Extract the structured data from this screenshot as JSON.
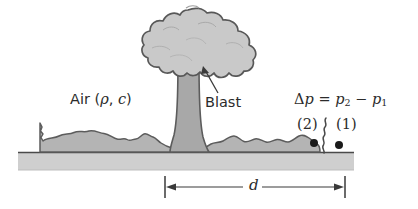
{
  "figure": {
    "labels": {
      "air_prefix": "Air (",
      "air_rho": "ρ",
      "air_comma": ", ",
      "air_c": "c",
      "air_suffix": ")",
      "blast": "Blast",
      "delta": "Δ",
      "eq_p": "p",
      "eq_equals": " = ",
      "eq_p2": "p",
      "eq_sub2": "2",
      "eq_minus": " − ",
      "eq_p1": "p",
      "eq_sub1": "1",
      "point_2": "(2)",
      "point_1": "(1)",
      "distance": "d"
    },
    "colors": {
      "cloud_fill": "#c9c9c9",
      "cloud_stroke": "#585858",
      "stem_fill": "#a8a8a8",
      "debris_fill": "#b4b4b4",
      "ground_fill": "#cfcfcf",
      "ground_line": "#555555",
      "text": "#2b2b2b",
      "background": "#ffffff",
      "dot": "#1a1a1a",
      "leader": "#3a3a3a"
    },
    "geometry": {
      "ground_top_y": 151,
      "ground_bottom_y": 170,
      "dim_line_y": 187,
      "dim_left_x": 165,
      "dim_right_x": 345,
      "point2_x": 314,
      "point2_y": 143,
      "point1_x": 338,
      "point1_y": 145
    }
  }
}
